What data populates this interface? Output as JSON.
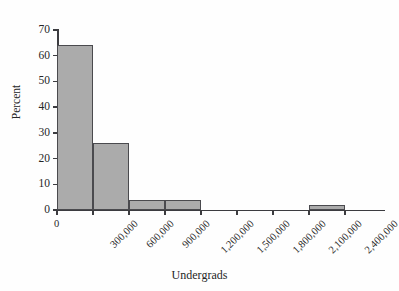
{
  "page": {
    "cropped_top_line": "are as much as the US States. Notice that about 12% of the uni"
  },
  "chart_data": {
    "type": "bar",
    "title": "",
    "xlabel": "Undergrads",
    "ylabel": "Percent",
    "xlim": [
      0,
      2700000
    ],
    "ylim": [
      0,
      72
    ],
    "grid": false,
    "legend": null,
    "bin_width": 300000,
    "x_ticks": [
      "0",
      "300,000",
      "600,000",
      "900,000",
      "1,200,000",
      "1,500,000",
      "1,800,000",
      "2,100,000",
      "2,400,000"
    ],
    "x_tick_values": [
      0,
      300000,
      600000,
      900000,
      1200000,
      1500000,
      1800000,
      2100000,
      2400000
    ],
    "y_ticks": [
      "0",
      "10",
      "20",
      "30",
      "40",
      "50",
      "60",
      "70"
    ],
    "y_tick_values": [
      0,
      10,
      20,
      30,
      40,
      50,
      60,
      70
    ],
    "categories": [
      "0-300,000",
      "300,000-600,000",
      "600,000-900,000",
      "900,000-1,200,000",
      "1,200,000-1,500,000",
      "1,500,000-1,800,000",
      "1,800,000-2,100,000",
      "2,100,000-2,400,000"
    ],
    "bin_starts": [
      0,
      300000,
      600000,
      900000,
      1200000,
      1500000,
      1800000,
      2100000
    ],
    "values": [
      64,
      26,
      4,
      4,
      0,
      0,
      0,
      2
    ]
  }
}
